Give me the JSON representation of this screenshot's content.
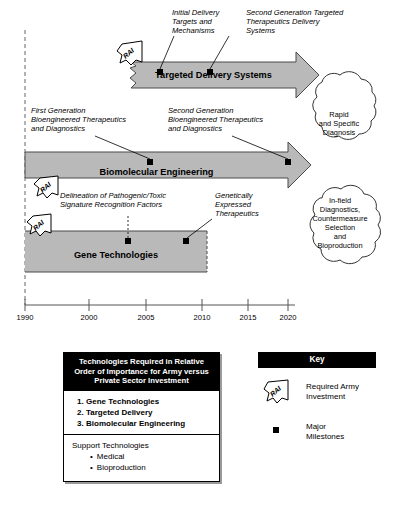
{
  "diagram": {
    "colors": {
      "bar_fill": "#b9b9b9",
      "bar_stroke": "#4a4a4a",
      "header_bg": "#000000",
      "header_fg": "#ffffff",
      "shadow": "#9a9a9a"
    }
  },
  "tracks": [
    {
      "id": "targeted-delivery-systems",
      "label": "Targeted Delivery Systems"
    },
    {
      "id": "biomolecular-engineering",
      "label": "Biomolecular Engineering"
    },
    {
      "id": "gene-technologies",
      "label": "Gene Technologies"
    }
  ],
  "callouts": [
    {
      "id": "initial-delivery",
      "text": "Initial Delivery\nTargets and\nMechanisms"
    },
    {
      "id": "second-gen-targeted",
      "text": "Second Generation Targeted\nTherapeutics Delivery\nSystems"
    },
    {
      "id": "first-gen-bioeng",
      "text": "First Generation\nBioengineered Therapeutics\nand Diagnostics"
    },
    {
      "id": "second-gen-bioeng",
      "text": "Second Generation\nBioengineered Therapeutics\nand Diagnostics"
    },
    {
      "id": "delineation",
      "text": "Delineation of Pathogenic/Toxic\nSignature Recognition Factors"
    },
    {
      "id": "genetically-expressed",
      "text": "Genetically\nExpressed\nTherapeutics"
    }
  ],
  "clouds": [
    {
      "id": "rapid-specific-diagnosis",
      "text": "Rapid\nand Specific\nDiagnosis"
    },
    {
      "id": "in-field-diagnostics",
      "text": "In-field\nDiagnostics,\nCountermeasure\nSelection\nand\nBioproduction"
    }
  ],
  "badges": [
    {
      "id": "rai-targeted-delivery",
      "label": "RAI"
    },
    {
      "id": "rai-biomolecular",
      "label": "RAI"
    },
    {
      "id": "rai-gene-tech",
      "label": "RAI"
    }
  ],
  "axis": {
    "ticks": [
      {
        "label": "1990",
        "x": 25
      },
      {
        "label": "2000",
        "x": 89
      },
      {
        "label": "2005",
        "x": 146
      },
      {
        "label": "2010",
        "x": 202
      },
      {
        "label": "2015",
        "x": 248
      },
      {
        "label": "2020",
        "x": 288
      }
    ]
  },
  "legend_box": {
    "header": "Technologies Required in Relative Order of Importance for Army versus Private Sector Investment",
    "ranked": [
      "Gene Technologies",
      "Targeted Delivery",
      "Biomolecular Engineering"
    ],
    "support_title": "Support Technologies",
    "support_items": [
      "Medical",
      "Bioproduction"
    ]
  },
  "key_panel": {
    "header": "Key",
    "items": [
      {
        "id": "required-army-investment",
        "label": "Required Army\nInvestment",
        "symbol": "rai-flag"
      },
      {
        "id": "major-milestones",
        "label": "Major\nMilestones",
        "symbol": "black-square"
      }
    ]
  }
}
